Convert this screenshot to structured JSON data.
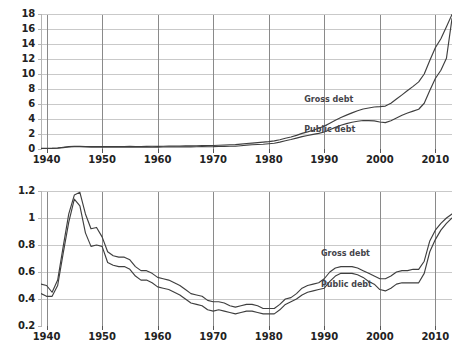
{
  "chart_data": [
    {
      "type": "line",
      "title": "Debt (trillions of 2009 $)",
      "xlabel": "",
      "ylabel": "",
      "xlim": [
        1939,
        2013
      ],
      "ylim": [
        0,
        18
      ],
      "xticks": [
        1940,
        1950,
        1960,
        1970,
        1980,
        1990,
        2000,
        2010
      ],
      "xtick_labels": [
        "1940",
        "1950",
        "1960",
        "1970",
        "1980",
        "1990",
        "2000",
        "2010"
      ],
      "yticks": [
        0,
        2,
        4,
        6,
        8,
        10,
        12,
        14,
        16,
        18
      ],
      "ytick_labels": [
        "0",
        "2",
        "4",
        "6",
        "8",
        "10",
        "12",
        "14",
        "16",
        "18"
      ],
      "grid": true,
      "legend": "inline-annotations",
      "x": [
        1939,
        1940,
        1941,
        1942,
        1943,
        1944,
        1945,
        1946,
        1947,
        1948,
        1949,
        1950,
        1951,
        1952,
        1953,
        1954,
        1955,
        1956,
        1957,
        1958,
        1959,
        1960,
        1961,
        1962,
        1963,
        1964,
        1965,
        1966,
        1967,
        1968,
        1969,
        1970,
        1971,
        1972,
        1973,
        1974,
        1975,
        1976,
        1977,
        1978,
        1979,
        1980,
        1981,
        1982,
        1983,
        1984,
        1985,
        1986,
        1987,
        1988,
        1989,
        1990,
        1991,
        1992,
        1993,
        1994,
        1995,
        1996,
        1997,
        1998,
        1999,
        2000,
        2001,
        2002,
        2003,
        2004,
        2005,
        2006,
        2007,
        2008,
        2009,
        2010,
        2011,
        2012,
        2013
      ],
      "series": [
        {
          "name": "Gross debt",
          "values": [
            0.08,
            0.09,
            0.1,
            0.14,
            0.23,
            0.31,
            0.36,
            0.36,
            0.34,
            0.33,
            0.33,
            0.34,
            0.33,
            0.33,
            0.34,
            0.34,
            0.35,
            0.34,
            0.34,
            0.35,
            0.36,
            0.36,
            0.37,
            0.38,
            0.39,
            0.4,
            0.41,
            0.41,
            0.43,
            0.45,
            0.45,
            0.47,
            0.5,
            0.53,
            0.56,
            0.58,
            0.65,
            0.73,
            0.79,
            0.85,
            0.91,
            0.98,
            1.08,
            1.23,
            1.43,
            1.6,
            1.82,
            2.08,
            2.28,
            2.5,
            2.76,
            3.05,
            3.44,
            3.83,
            4.2,
            4.52,
            4.82,
            5.1,
            5.33,
            5.47,
            5.6,
            5.65,
            5.72,
            6.1,
            6.67,
            7.22,
            7.79,
            8.35,
            8.95,
            10.0,
            11.8,
            13.5,
            14.7,
            16.3,
            17.95
          ]
        },
        {
          "name": "Public debt",
          "values": [
            0.06,
            0.07,
            0.08,
            0.11,
            0.19,
            0.26,
            0.31,
            0.3,
            0.27,
            0.25,
            0.25,
            0.25,
            0.24,
            0.24,
            0.25,
            0.25,
            0.25,
            0.24,
            0.24,
            0.25,
            0.26,
            0.25,
            0.26,
            0.27,
            0.27,
            0.28,
            0.28,
            0.28,
            0.3,
            0.31,
            0.3,
            0.31,
            0.34,
            0.35,
            0.36,
            0.37,
            0.44,
            0.51,
            0.56,
            0.6,
            0.64,
            0.7,
            0.77,
            0.92,
            1.1,
            1.26,
            1.45,
            1.65,
            1.8,
            1.95,
            2.08,
            2.26,
            2.56,
            2.88,
            3.16,
            3.38,
            3.56,
            3.7,
            3.8,
            3.78,
            3.75,
            3.6,
            3.52,
            3.77,
            4.13,
            4.5,
            4.8,
            5.05,
            5.3,
            6.1,
            7.8,
            9.4,
            10.5,
            12.1,
            17.4
          ]
        }
      ],
      "annotations": [
        {
          "text": "Gross debt",
          "x": 1990,
          "y": 6.5
        },
        {
          "text": "Public debt",
          "x": 1990,
          "y": 2.6
        }
      ]
    },
    {
      "type": "line",
      "title": "Debt as a fraction of GDP",
      "xlabel": "",
      "ylabel": "",
      "xlim": [
        1939,
        2013
      ],
      "ylim": [
        0.2,
        1.2
      ],
      "xticks": [
        1940,
        1950,
        1960,
        1970,
        1980,
        1990,
        2000,
        2010
      ],
      "xtick_labels": [
        "1940",
        "1950",
        "1960",
        "1970",
        "1980",
        "1990",
        "2000",
        "2010"
      ],
      "yticks": [
        0.2,
        0.4,
        0.6,
        0.8,
        1.0,
        1.2
      ],
      "ytick_labels": [
        "0.2",
        "0.4",
        "0.6",
        "0.8",
        "1",
        "1.2"
      ],
      "grid": true,
      "legend": "inline-annotations",
      "x": [
        1939,
        1940,
        1941,
        1942,
        1943,
        1944,
        1945,
        1946,
        1947,
        1948,
        1949,
        1950,
        1951,
        1952,
        1953,
        1954,
        1955,
        1956,
        1957,
        1958,
        1959,
        1960,
        1961,
        1962,
        1963,
        1964,
        1965,
        1966,
        1967,
        1968,
        1969,
        1970,
        1971,
        1972,
        1973,
        1974,
        1975,
        1976,
        1977,
        1978,
        1979,
        1980,
        1981,
        1982,
        1983,
        1984,
        1985,
        1986,
        1987,
        1988,
        1989,
        1990,
        1991,
        1992,
        1993,
        1994,
        1995,
        1996,
        1997,
        1998,
        1999,
        2000,
        2001,
        2002,
        2003,
        2004,
        2005,
        2006,
        2007,
        2008,
        2009,
        2010,
        2011,
        2012,
        2013
      ],
      "series": [
        {
          "name": "Gross debt",
          "values": [
            0.51,
            0.5,
            0.45,
            0.54,
            0.79,
            1.03,
            1.17,
            1.19,
            1.03,
            0.92,
            0.93,
            0.86,
            0.75,
            0.72,
            0.71,
            0.71,
            0.69,
            0.64,
            0.61,
            0.61,
            0.59,
            0.56,
            0.55,
            0.54,
            0.52,
            0.5,
            0.47,
            0.44,
            0.43,
            0.42,
            0.39,
            0.38,
            0.38,
            0.37,
            0.35,
            0.34,
            0.35,
            0.36,
            0.36,
            0.35,
            0.33,
            0.33,
            0.33,
            0.36,
            0.4,
            0.41,
            0.44,
            0.48,
            0.5,
            0.51,
            0.52,
            0.55,
            0.6,
            0.63,
            0.64,
            0.64,
            0.64,
            0.63,
            0.61,
            0.59,
            0.57,
            0.55,
            0.55,
            0.57,
            0.6,
            0.61,
            0.61,
            0.62,
            0.62,
            0.68,
            0.83,
            0.91,
            0.96,
            1.0,
            1.03
          ]
        },
        {
          "name": "Public debt",
          "values": [
            0.44,
            0.42,
            0.42,
            0.5,
            0.74,
            0.97,
            1.14,
            1.09,
            0.89,
            0.79,
            0.8,
            0.79,
            0.67,
            0.65,
            0.64,
            0.64,
            0.62,
            0.57,
            0.54,
            0.54,
            0.52,
            0.49,
            0.48,
            0.47,
            0.45,
            0.43,
            0.4,
            0.37,
            0.36,
            0.35,
            0.32,
            0.31,
            0.32,
            0.31,
            0.3,
            0.29,
            0.3,
            0.31,
            0.31,
            0.3,
            0.29,
            0.29,
            0.29,
            0.32,
            0.36,
            0.38,
            0.4,
            0.43,
            0.45,
            0.46,
            0.47,
            0.48,
            0.53,
            0.57,
            0.59,
            0.59,
            0.59,
            0.58,
            0.56,
            0.53,
            0.51,
            0.47,
            0.46,
            0.48,
            0.51,
            0.52,
            0.52,
            0.52,
            0.52,
            0.59,
            0.75,
            0.84,
            0.91,
            0.96,
            1.0
          ]
        }
      ],
      "annotations": [
        {
          "text": "Gross debt",
          "x": 1993,
          "y": 0.735
        },
        {
          "text": "Public debt",
          "x": 1993,
          "y": 0.505
        }
      ]
    }
  ],
  "style": {
    "line_color": "#3f3f3f",
    "grid_h_color": "#c9c9c9",
    "grid_v_color": "#8a8a8a",
    "axis_color": "#b5b5b5",
    "text_color": "#222222",
    "title_color": "#44444a",
    "background": "#ffffff"
  }
}
